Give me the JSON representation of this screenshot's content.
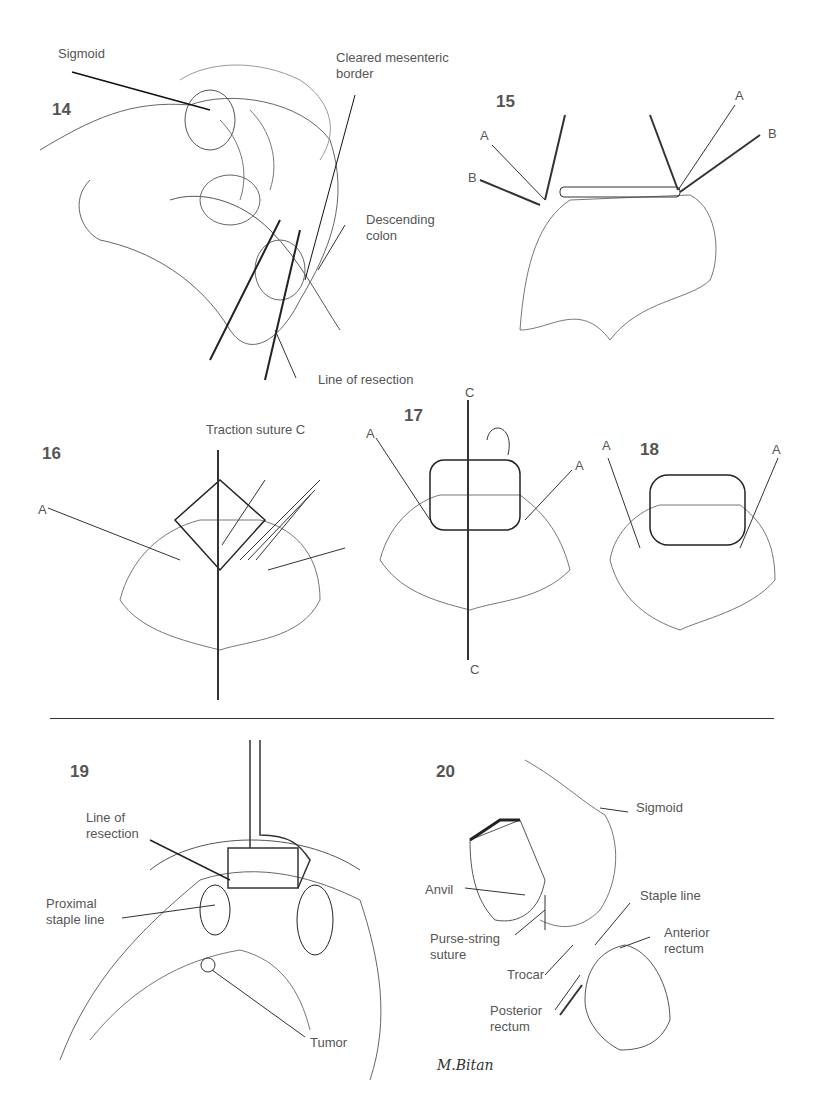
{
  "figures": [
    {
      "number": "14",
      "labels": {
        "sigmoid": "Sigmoid",
        "cleared": "Cleared mesenteric border",
        "cleared_l1": "Cleared mesenteric",
        "cleared_l2": "border",
        "descending_l1": "Descending",
        "descending_l2": "colon",
        "resection": "Line of resection"
      }
    },
    {
      "number": "15",
      "labels": {
        "a_left": "A",
        "b_left": "B",
        "a_right": "A",
        "b_right": "B"
      }
    },
    {
      "number": "16",
      "labels": {
        "traction": "Traction suture C",
        "a": "A"
      }
    },
    {
      "number": "17",
      "labels": {
        "a_left": "A",
        "a_right": "A",
        "c_top": "C",
        "c_bottom": "C"
      }
    },
    {
      "number": "18",
      "labels": {
        "a_left": "A",
        "a_right": "A"
      }
    },
    {
      "number": "19",
      "labels": {
        "resection_l1": "Line of",
        "resection_l2": "resection",
        "proximal_l1": "Proximal",
        "proximal_l2": "staple line",
        "tumor": "Tumor"
      }
    },
    {
      "number": "20",
      "labels": {
        "sigmoid": "Sigmoid",
        "anvil": "Anvil",
        "staple": "Staple line",
        "purse_l1": "Purse-string",
        "purse_l2": "suture",
        "anterior_l1": "Anterior",
        "anterior_l2": "rectum",
        "trocar": "Trocar",
        "posterior_l1": "Posterior",
        "posterior_l2": "rectum"
      }
    }
  ],
  "signature": "M.Bitan"
}
